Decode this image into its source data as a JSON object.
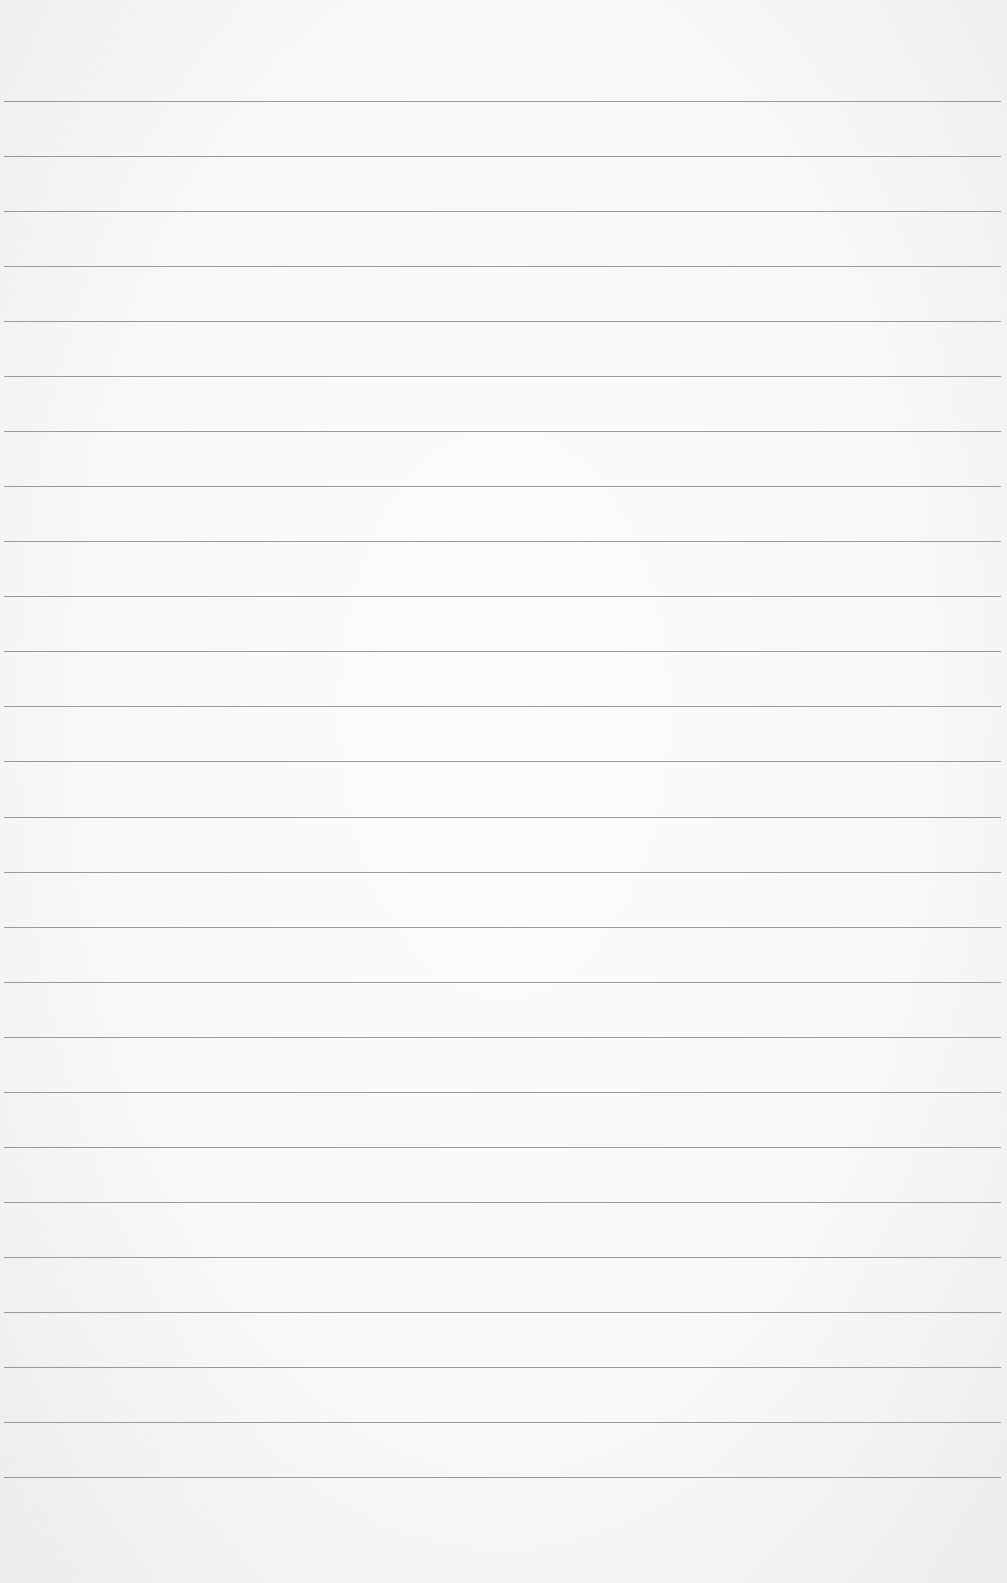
{
  "paper": {
    "background_color": "#f8f8f7",
    "line_color": "#8a8a8a",
    "first_line_y": 101,
    "line_spacing": 55.04,
    "line_count": 26
  }
}
